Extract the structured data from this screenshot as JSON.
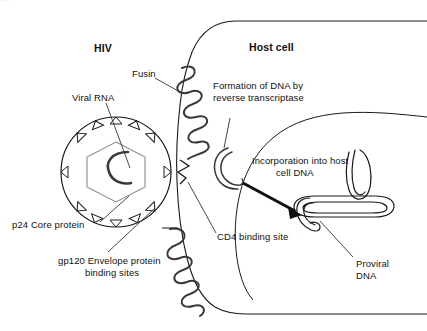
{
  "figure": {
    "title_hidden_fragment": "···",
    "background_color": "#ffffff",
    "stroke_color": "#1a1a1a",
    "core_stroke_color": "#8c8c8c",
    "width": 427,
    "height": 331
  },
  "headings": {
    "hiv": "HIV",
    "host_cell": "Host cell"
  },
  "labels": {
    "viral_rna": "Viral RNA",
    "fusin": "Fusin",
    "formation_line1": "Formation of DNA by",
    "formation_line2": "reverse transcriptase",
    "incorporation_line1": "Incorporation into host",
    "incorporation_line2": "cell DNA",
    "p24": "p24 Core protein",
    "gp120_line1": "gp120 Envelope protein",
    "gp120_line2": "binding sites",
    "cd4": "CD4 binding site",
    "proviral_line1": "Proviral",
    "proviral_line2": "DNA"
  },
  "structures": {
    "virion": "hiv-virion-particle",
    "envelope_spikes": "gp120-spike-triangles",
    "capsid": "p24-hexagonal-core",
    "rna": "viral-rna-strand",
    "fusin_receptor": "fusin-coreceptor-coil",
    "cd4_receptor": "cd4-receptor-coil",
    "cell_membrane": "host-cell-membrane",
    "nucleus": "host-cell-nucleus",
    "new_dna": "newly-formed-viral-dna",
    "host_dna": "host-chromosomal-dna",
    "proviral_dna": "integrated-proviral-dna",
    "incorporation_arrow": "incorporation-arrow"
  }
}
